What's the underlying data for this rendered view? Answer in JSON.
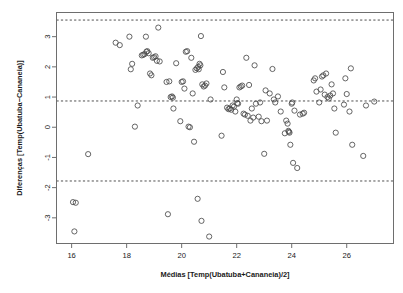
{
  "chart_data": {
    "type": "scatter",
    "title": "",
    "xlabel": "Médias [Temp(Ubatuba+Cananeia)/2]",
    "ylabel": "Diferenças [Temp(Ubatuba−Cananeia)]",
    "xlim": [
      15.45,
      27.7
    ],
    "ylim": [
      -3.85,
      3.8
    ],
    "xticks": [
      16,
      18,
      20,
      22,
      24,
      26
    ],
    "yticks": [
      -3,
      -2,
      -1,
      0,
      1,
      2,
      3
    ],
    "xtick_labels": [
      "16",
      "18",
      "20",
      "22",
      "24",
      "26"
    ],
    "ytick_labels": [
      "-3",
      "-2",
      "-1",
      "0",
      "1",
      "2",
      "3"
    ],
    "grid": false,
    "legend": false,
    "marker": "open-circle",
    "marker_size": 2.6,
    "point_color": "#4a4a4a",
    "frame_color": "#6e6e6e",
    "reference_lines": [
      {
        "name": "upper-limit-of-agreement",
        "value": 3.55,
        "style": "dashed",
        "color": "#3c3c3c"
      },
      {
        "name": "mean-difference",
        "value": 0.87,
        "style": "dashed",
        "color": "#3c3c3c"
      },
      {
        "name": "lower-limit-of-agreement",
        "value": -1.78,
        "style": "dashed",
        "color": "#3c3c3c"
      }
    ],
    "x": [
      16.05,
      16.1,
      16.15,
      16.6,
      17.6,
      17.75,
      18.1,
      18.15,
      18.2,
      18.3,
      18.4,
      18.55,
      18.6,
      18.65,
      18.7,
      18.72,
      18.75,
      18.8,
      18.85,
      18.9,
      18.95,
      19.0,
      19.05,
      19.1,
      19.15,
      19.2,
      19.45,
      19.5,
      19.55,
      19.6,
      19.65,
      19.68,
      19.7,
      19.8,
      19.95,
      20.0,
      20.05,
      20.1,
      20.15,
      20.2,
      20.25,
      20.3,
      20.35,
      20.4,
      20.45,
      20.5,
      20.55,
      20.58,
      20.6,
      20.62,
      20.65,
      20.68,
      20.7,
      20.72,
      20.75,
      20.8,
      20.85,
      20.9,
      21.0,
      21.05,
      21.45,
      21.5,
      21.55,
      21.65,
      21.7,
      21.75,
      21.8,
      21.85,
      21.9,
      21.95,
      22.0,
      22.02,
      22.05,
      22.1,
      22.15,
      22.2,
      22.25,
      22.3,
      22.35,
      22.4,
      22.45,
      22.5,
      22.55,
      22.6,
      22.65,
      22.7,
      22.8,
      22.85,
      22.9,
      23.0,
      23.05,
      23.1,
      23.2,
      23.3,
      23.35,
      23.4,
      23.5,
      23.6,
      23.75,
      23.8,
      23.85,
      23.88,
      23.9,
      23.92,
      23.95,
      24.0,
      24.02,
      24.05,
      24.1,
      24.2,
      24.3,
      24.4,
      24.45,
      24.8,
      24.85,
      24.9,
      25.0,
      25.05,
      25.1,
      25.15,
      25.2,
      25.25,
      25.3,
      25.35,
      25.4,
      25.45,
      25.5,
      25.55,
      25.6,
      25.9,
      25.95,
      26.0,
      26.1,
      26.15,
      26.2,
      26.6,
      26.7,
      27.0
    ],
    "y": [
      -2.48,
      -3.45,
      -2.5,
      -0.89,
      2.8,
      2.72,
      3.0,
      1.92,
      2.1,
      0.02,
      0.72,
      2.38,
      2.4,
      2.42,
      3.0,
      2.5,
      2.52,
      2.45,
      1.78,
      1.72,
      2.3,
      2.32,
      2.35,
      2.2,
      3.3,
      2.18,
      1.5,
      -2.88,
      1.52,
      1.0,
      1.02,
      0.98,
      0.62,
      2.12,
      0.2,
      1.5,
      1.52,
      1.28,
      2.5,
      2.52,
      0.02,
      0.0,
      2.3,
      1.12,
      -0.48,
      1.9,
      1.95,
      -2.37,
      2.0,
      1.92,
      2.1,
      2.05,
      3.02,
      -3.1,
      1.42,
      1.35,
      1.38,
      1.45,
      -3.62,
      0.92,
      -0.28,
      1.83,
      1.32,
      0.65,
      0.6,
      0.62,
      0.58,
      0.72,
      0.68,
      0.52,
      0.92,
      0.8,
      0.78,
      1.32,
      1.35,
      1.38,
      0.45,
      0.42,
      2.3,
      0.38,
      1.4,
      0.22,
      0.62,
      0.32,
      2.05,
      0.78,
      0.35,
      0.82,
      0.2,
      -0.88,
      1.22,
      0.22,
      1.12,
      1.93,
      0.92,
      0.82,
      1.02,
      0.52,
      -0.2,
      0.22,
      0.12,
      -0.12,
      -0.15,
      -0.18,
      -0.58,
      0.78,
      0.82,
      -1.18,
      0.55,
      -1.35,
      0.42,
      0.45,
      0.48,
      1.55,
      1.62,
      1.18,
      0.82,
      1.25,
      1.68,
      1.72,
      1.08,
      1.78,
      1.0,
      0.95,
      1.05,
      1.42,
      1.12,
      0.62,
      -0.18,
      0.75,
      1.62,
      1.1,
      0.52,
      1.95,
      -0.58,
      -0.95,
      0.72,
      0.85,
      1.02,
      1.32
    ]
  },
  "axis": {
    "xlabel": "Médias [Temp(Ubatuba+Cananeia)/2]",
    "ylabel": "Diferenças [Temp(Ubatuba−Cananeia)]"
  }
}
